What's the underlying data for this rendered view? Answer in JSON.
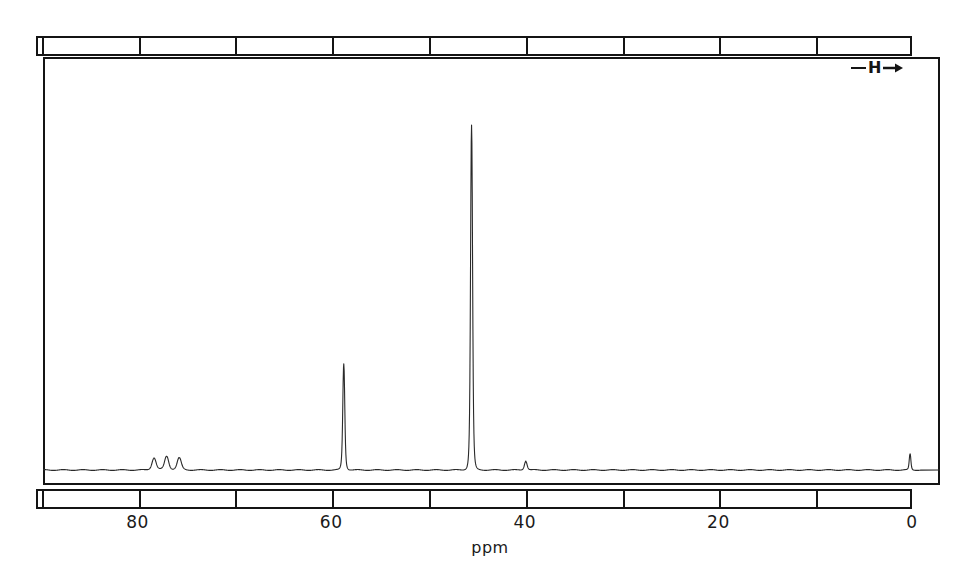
{
  "figure": {
    "kind": "nmr-spectrum",
    "axis_unit": "ppm",
    "sweep_marker": {
      "symbol": "H",
      "description": "field-sweep direction arrow pointing right"
    },
    "colors": {
      "ink": "#141414",
      "trace": "#2a2a2a",
      "background": "#ffffff"
    }
  },
  "axis": {
    "labels": [
      {
        "text": "80",
        "ppm": 80
      },
      {
        "text": "60",
        "ppm": 60
      },
      {
        "text": "40",
        "ppm": 40
      },
      {
        "text": "20",
        "ppm": 20
      },
      {
        "text": "0",
        "ppm": 0
      }
    ],
    "tick_ppm": [
      90,
      80,
      70,
      60,
      50,
      40,
      30,
      20,
      10,
      0
    ]
  },
  "chart_data": {
    "type": "line",
    "title": "",
    "subtitle": "",
    "xlabel": "ppm",
    "ylabel": "",
    "xlim": [
      90.5,
      -0.5
    ],
    "ylim": [
      0,
      1
    ],
    "grid": false,
    "legend": null,
    "x_axis_reversed": true,
    "annotations": [
      {
        "text": "H",
        "kind": "sweep-direction-arrow",
        "ppm": 4.5,
        "intensity": 0.95
      }
    ],
    "series": [
      {
        "name": "13C NMR trace",
        "baseline_intensity": 0.012,
        "peaks": [
          {
            "ppm": 78.3,
            "intensity": 0.03,
            "width_ppm": 0.45,
            "label": "solvent"
          },
          {
            "ppm": 77.0,
            "intensity": 0.034,
            "width_ppm": 0.45,
            "label": "solvent"
          },
          {
            "ppm": 75.7,
            "intensity": 0.03,
            "width_ppm": 0.45,
            "label": "solvent"
          },
          {
            "ppm": 58.7,
            "intensity": 0.262,
            "width_ppm": 0.22,
            "label": ""
          },
          {
            "ppm": 45.5,
            "intensity": 0.852,
            "width_ppm": 0.22,
            "label": ""
          },
          {
            "ppm": 39.9,
            "intensity": 0.022,
            "width_ppm": 0.3,
            "label": ""
          },
          {
            "ppm": 0.2,
            "intensity": 0.04,
            "width_ppm": 0.18,
            "label": "reference"
          }
        ]
      }
    ]
  }
}
